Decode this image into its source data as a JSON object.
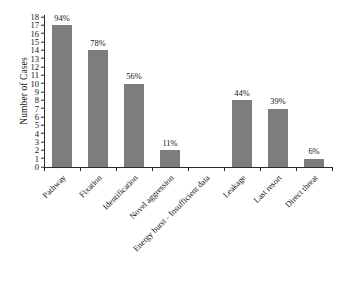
{
  "chart_data": {
    "type": "bar",
    "title": "",
    "subtitle": "",
    "xlabel": "",
    "ylabel": "Number of Cases",
    "ylim": [
      0,
      18
    ],
    "ytick_step": 1,
    "grid": false,
    "legend": false,
    "bar_color": "#7d7d7d",
    "axis_color": "#2b2b2b",
    "background": "#ffffff",
    "categories": [
      "Pathway",
      "Fixation",
      "Identification",
      "Novel aggression",
      "Energy burst - Insufficient data",
      "Leakage",
      "Last resort",
      "Direct threat"
    ],
    "values": [
      17,
      14,
      10,
      2,
      0,
      8,
      7,
      1
    ],
    "data_labels": [
      "94%",
      "78%",
      "56%",
      "11%",
      "",
      "44%",
      "39%",
      "6%"
    ],
    "yticks": [
      "0",
      "1",
      "2",
      "3",
      "4",
      "5",
      "6",
      "7",
      "8",
      "9",
      "10",
      "11",
      "12",
      "13",
      "14",
      "15",
      "16",
      "17",
      "18"
    ]
  }
}
